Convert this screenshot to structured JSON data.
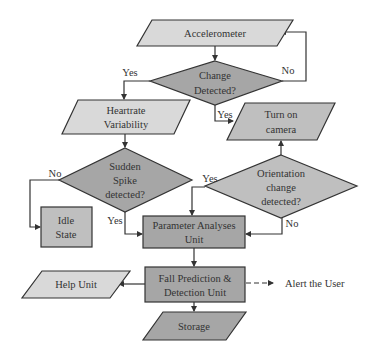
{
  "colors": {
    "light_fill": "#d9d9d9",
    "dark_fill": "#a6a6a6",
    "mid_fill": "#bfbfbf",
    "stroke": "#333333",
    "text": "#333333"
  },
  "nodes": {
    "accelerometer": {
      "label": "Accelerometer",
      "shape": "parallelogram"
    },
    "change_detected": {
      "line1": "Change",
      "line2": "Detected?",
      "shape": "diamond"
    },
    "heartrate": {
      "line1": "Heartrate",
      "line2": "Variability",
      "shape": "parallelogram"
    },
    "turn_on_camera": {
      "line1": "Turn on",
      "line2": "camera",
      "shape": "parallelogram"
    },
    "sudden_spike": {
      "line1": "Sudden",
      "line2": "Spike",
      "line3": "detected?",
      "shape": "diamond"
    },
    "orientation": {
      "line1": "Orientation",
      "line2": "change",
      "line3": "detected?",
      "shape": "diamond"
    },
    "idle_state": {
      "line1": "Idle",
      "line2": "State",
      "shape": "rectangle"
    },
    "parameter_analyses": {
      "line1": "Parameter Analyses",
      "line2": "Unit",
      "shape": "rectangle"
    },
    "fall_prediction": {
      "line1": "Fall Prediction &",
      "line2": "Detection Unit",
      "shape": "rectangle"
    },
    "help_unit": {
      "label": "Help Unit",
      "shape": "parallelogram"
    },
    "storage": {
      "label": "Storage",
      "shape": "parallelogram"
    },
    "alert": {
      "label": "Alert the User",
      "shape": "text"
    }
  },
  "edges": {
    "change_yes_left": "Yes",
    "change_no": "No",
    "change_yes_down": "Yes",
    "spike_no": "No",
    "spike_yes": "Yes",
    "orientation_yes": "Yes",
    "orientation_no": "No"
  }
}
